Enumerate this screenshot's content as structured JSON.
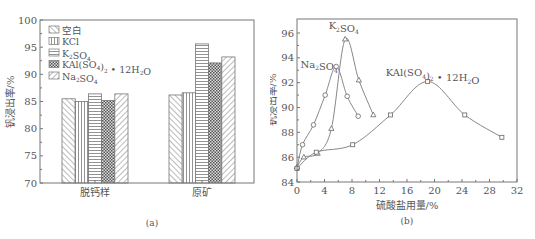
{
  "chart_data": [
    {
      "type": "bar",
      "panel_label": "(a)",
      "title": "",
      "xlabel": "",
      "ylabel": "钒浸出率/%",
      "ylim": [
        70,
        100
      ],
      "yticks": [
        70,
        75,
        80,
        85,
        90,
        95,
        100
      ],
      "categories": [
        "脱钙样",
        "原矿"
      ],
      "legend_position": "upper-left",
      "grid": false,
      "series": [
        {
          "name": "空白",
          "pattern": "diagonal-back",
          "values": [
            85.5,
            86.2
          ]
        },
        {
          "name": "KCl",
          "pattern": "vertical",
          "values": [
            85.0,
            86.6
          ]
        },
        {
          "name": "K₂SO₄",
          "pattern": "horizontal",
          "values": [
            86.4,
            95.6
          ]
        },
        {
          "name": "KAl(SO₄)₂ • 12H₂O",
          "pattern": "crosshatch",
          "values": [
            85.2,
            92.1
          ]
        },
        {
          "name": "Na₂SO₄",
          "pattern": "diagonal-forward",
          "values": [
            86.4,
            93.2
          ]
        }
      ]
    },
    {
      "type": "line",
      "panel_label": "(b)",
      "title": "",
      "xlabel": "硫酸盐用量/%",
      "ylabel": "钒浸出率/%",
      "xlim": [
        0,
        32
      ],
      "ylim": [
        84,
        97
      ],
      "xticks": [
        0,
        4,
        8,
        12,
        16,
        20,
        24,
        28,
        32
      ],
      "yticks": [
        84,
        86,
        88,
        90,
        92,
        94,
        96
      ],
      "grid": false,
      "series": [
        {
          "name": "Na₂SO₄",
          "marker": "circle",
          "label_pos": [
            0.5,
            93.2
          ],
          "x": [
            0,
            0.8,
            2.4,
            4.1,
            5.7,
            7.3,
            8.9
          ],
          "y": [
            85.1,
            87.0,
            88.6,
            91.0,
            93.3,
            90.9,
            89.3
          ]
        },
        {
          "name": "K₂SO₄",
          "marker": "triangle",
          "label_pos": [
            4.6,
            96.3
          ],
          "x": [
            0,
            1.0,
            3.0,
            5.0,
            7.0,
            9.0,
            11.1
          ],
          "y": [
            85.2,
            86.0,
            86.3,
            88.3,
            95.5,
            92.2,
            89.4
          ]
        },
        {
          "name": "KAl(SO₄)₂ • 12H₂O",
          "marker": "square",
          "label_pos": [
            12.9,
            92.5
          ],
          "x": [
            0,
            2.8,
            8.1,
            13.6,
            19.0,
            24.4,
            29.8
          ],
          "y": [
            85.1,
            86.4,
            87.0,
            89.4,
            92.1,
            89.4,
            87.6
          ]
        }
      ]
    }
  ],
  "captions": {
    "a": "(a)",
    "b": "(b)"
  },
  "colors": {
    "axis": "#777777",
    "line": "#888888",
    "text": "#555555"
  }
}
